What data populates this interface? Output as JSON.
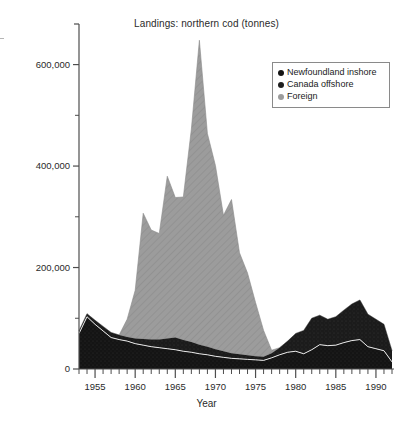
{
  "chart_data": {
    "type": "area",
    "stacked": true,
    "title": "Landings: northern cod (tonnes)",
    "xlabel": "Year",
    "ylabel": "",
    "xlim": [
      1953,
      1992
    ],
    "ylim": [
      0,
      680000
    ],
    "grid": false,
    "legend_position": "top-right",
    "x": [
      1953,
      1954,
      1955,
      1956,
      1957,
      1958,
      1959,
      1960,
      1961,
      1962,
      1963,
      1964,
      1965,
      1966,
      1967,
      1968,
      1969,
      1970,
      1971,
      1972,
      1973,
      1974,
      1975,
      1976,
      1977,
      1978,
      1979,
      1980,
      1981,
      1982,
      1983,
      1984,
      1985,
      1986,
      1987,
      1988,
      1989,
      1990,
      1991,
      1992
    ],
    "y_ticks": [
      0,
      200000,
      400000,
      600000
    ],
    "y_tick_labels": [
      "0",
      "200,000",
      "400,000",
      "600,000"
    ],
    "y_minor_ticks": [
      100000,
      300000,
      500000
    ],
    "x_ticks": [
      1955,
      1960,
      1965,
      1970,
      1975,
      1980,
      1985,
      1990
    ],
    "x_tick_labels": [
      "1955",
      "1960",
      "1965",
      "1970",
      "1975",
      "1980",
      "1985",
      "1990"
    ],
    "series": [
      {
        "name": "Newfoundland inshore",
        "color": "#141414",
        "values": [
          70000,
          103000,
          88000,
          75000,
          62000,
          58000,
          55000,
          50000,
          47000,
          44000,
          42000,
          40000,
          38000,
          35000,
          33000,
          30000,
          28000,
          25000,
          23000,
          21000,
          20000,
          19000,
          18000,
          17000,
          22000,
          28000,
          33000,
          35000,
          30000,
          38000,
          48000,
          46000,
          47000,
          52000,
          56000,
          58000,
          44000,
          40000,
          36000,
          14000
        ]
      },
      {
        "name": "Canada offshore",
        "color": "#1e1e1e",
        "values": [
          5000,
          6000,
          8000,
          9000,
          10000,
          9000,
          8000,
          10000,
          12000,
          14000,
          16000,
          20000,
          24000,
          22000,
          20000,
          18000,
          16000,
          14000,
          12000,
          10000,
          9000,
          8000,
          7000,
          7000,
          9000,
          14000,
          22000,
          35000,
          46000,
          62000,
          58000,
          52000,
          56000,
          64000,
          72000,
          78000,
          64000,
          58000,
          52000,
          22000
        ]
      },
      {
        "name": "Foreign",
        "color": "#9c9c9c",
        "values": [
          0,
          0,
          0,
          0,
          0,
          0,
          35000,
          95000,
          248000,
          216000,
          209000,
          320000,
          276000,
          282000,
          420000,
          600000,
          420000,
          362000,
          268000,
          303000,
          200000,
          162000,
          106000,
          52000,
          6000,
          0,
          0,
          0,
          0,
          0,
          0,
          0,
          0,
          0,
          0,
          0,
          0,
          0,
          0,
          0
        ]
      }
    ],
    "total_peak": {
      "year": 1968,
      "value": 648000
    }
  },
  "legend": {
    "items": [
      {
        "label": "Newfoundland inshore",
        "color": "#141414"
      },
      {
        "label": "Canada offshore",
        "color": "#1e1e1e"
      },
      {
        "label": "Foreign",
        "color": "#9c9c9c"
      }
    ]
  }
}
